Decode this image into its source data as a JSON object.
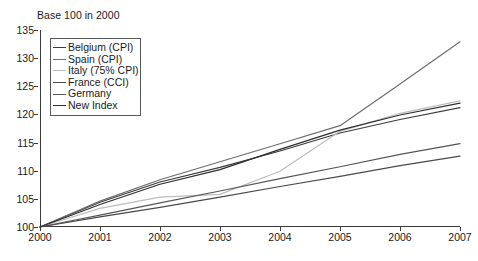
{
  "chart_data": {
    "type": "line",
    "title": "Base 100 in 2000",
    "xlabel": "",
    "ylabel": "",
    "x": [
      "2000",
      "2001",
      "2002",
      "2003",
      "2004",
      "2005",
      "2006",
      "2007"
    ],
    "categories": [
      "2000",
      "2001",
      "2002",
      "2003",
      "2004",
      "2005",
      "2006",
      "2007"
    ],
    "ylim": [
      100,
      135
    ],
    "yticks": [
      100,
      105,
      110,
      115,
      120,
      125,
      130,
      135
    ],
    "grid": false,
    "legend_position": "upper-left-inside",
    "series": [
      {
        "name": "Belgium (CPI)",
        "color": "#3c3c3c",
        "width": 1.2,
        "values": [
          100.0,
          104.4,
          108.0,
          110.6,
          113.5,
          116.7,
          119.1,
          121.2
        ]
      },
      {
        "name": "Spain (CPI)",
        "color": "#6e6e6e",
        "width": 1.2,
        "values": [
          100.0,
          104.6,
          108.4,
          111.6,
          114.8,
          118.0,
          125.4,
          132.9
        ]
      },
      {
        "name": "Italy (75% CPI)",
        "color": "#bdbdbd",
        "width": 1.2,
        "values": [
          100.0,
          103.3,
          105.3,
          105.8,
          109.9,
          117.0,
          120.2,
          122.4
        ]
      },
      {
        "name": "France (CCI)",
        "color": "#4a4a4a",
        "width": 1.2,
        "values": [
          100.0,
          101.8,
          103.5,
          105.3,
          107.2,
          109.0,
          110.9,
          112.6
        ]
      },
      {
        "name": "Germany",
        "color": "#555555",
        "width": 1.2,
        "values": [
          100.0,
          102.1,
          104.3,
          106.4,
          108.6,
          110.7,
          112.9,
          114.8
        ]
      },
      {
        "name": "New Index",
        "color": "#2e2e2e",
        "width": 1.2,
        "values": [
          100.0,
          104.0,
          107.6,
          110.2,
          113.8,
          117.2,
          119.9,
          122.0
        ]
      }
    ]
  }
}
